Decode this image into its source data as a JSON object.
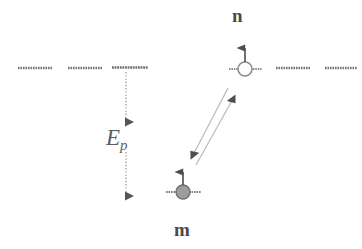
{
  "figure": {
    "type": "energy-level-diagram",
    "background_color": "#ffffff",
    "line_color": "#6e6e6e",
    "dark_marker_color": "#555555",
    "electron_fill_color": "#9a9a9a",
    "hole_fill_color": "#ffffff"
  },
  "labels": {
    "site_n": "n",
    "site_m": "m",
    "energy_symbol": "E",
    "energy_subscript": "p"
  },
  "levels": {
    "upper_band_y": 68,
    "lower_site_y": 192,
    "upper_dashes": [
      {
        "name": "dash-left-1",
        "x1": 18,
        "x2": 52
      },
      {
        "name": "dash-left-2",
        "x1": 68,
        "x2": 102
      },
      {
        "name": "dash-left-3",
        "x1": 112,
        "x2": 148
      },
      {
        "name": "dash-hole-left",
        "x1": 229,
        "x2": 239
      },
      {
        "name": "dash-hole-right",
        "x1": 251,
        "x2": 262
      },
      {
        "name": "dash-right-1",
        "x1": 276,
        "x2": 310
      },
      {
        "name": "dash-right-2",
        "x1": 325,
        "x2": 357
      }
    ],
    "lower_dashes": [
      {
        "name": "dash-electron-left",
        "x1": 166,
        "x2": 177
      },
      {
        "name": "dash-electron-right",
        "x1": 189,
        "x2": 201
      }
    ]
  },
  "particles": {
    "hole": {
      "name": "hole",
      "cx": 245,
      "cy": 69,
      "r": 7,
      "filled": false,
      "spin": "up"
    },
    "electron": {
      "name": "electron",
      "cx": 183,
      "cy": 192,
      "r": 7,
      "filled": true,
      "spin": "up"
    }
  },
  "arrows": {
    "energy_gap": {
      "name": "energy-gap-arrow",
      "x": 126,
      "y_top": 69,
      "y_bottom": 199,
      "double_headed": true,
      "style": "dotted"
    },
    "transition_up": {
      "name": "transition-arrow-up",
      "x1": 197,
      "y1": 163,
      "x2": 237,
      "y2": 95,
      "head_at": "end"
    },
    "transition_down": {
      "name": "transition-arrow-down",
      "x1": 229,
      "y1": 88,
      "x2": 190,
      "y2": 159,
      "head_at": "end"
    }
  }
}
